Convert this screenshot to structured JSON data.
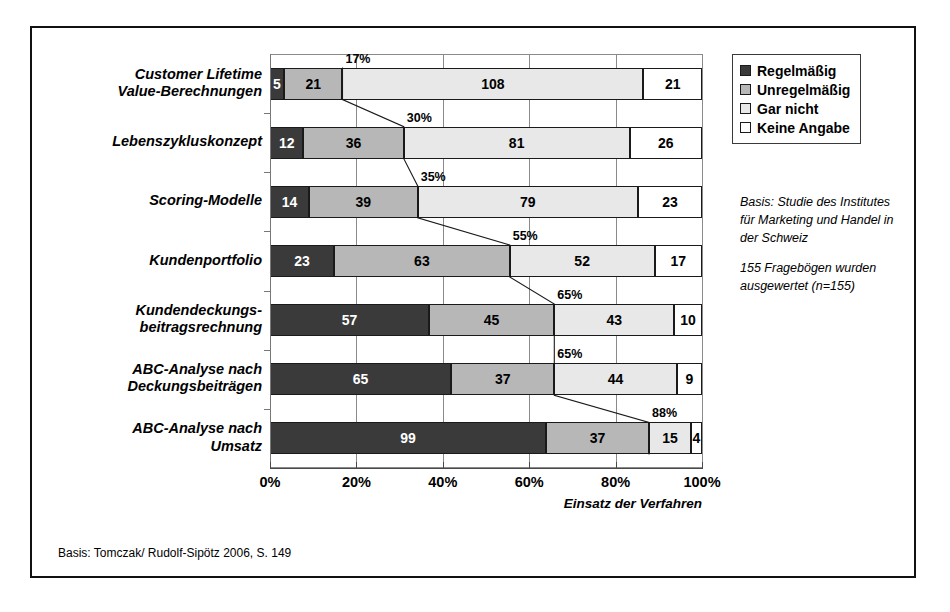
{
  "chart_data": {
    "type": "bar",
    "orientation": "horizontal",
    "stacked": true,
    "normalized": true,
    "title": "",
    "xlabel": "Einsatz der Verfahren",
    "ylabel": "",
    "xlim": [
      0,
      100
    ],
    "xticks": [
      "0%",
      "20%",
      "40%",
      "60%",
      "80%",
      "100%"
    ],
    "xtick_values": [
      0,
      20,
      40,
      60,
      80,
      100
    ],
    "grid": true,
    "legend_position": "top-right",
    "total": 155,
    "categories": [
      "Customer Lifetime Value-Berechnungen",
      "Lebenszykluskonzept",
      "Scoring-Modelle",
      "Kundenportfolio",
      "Kundendeckungs-beitragsrechnung",
      "ABC-Analyse nach Deckungsbeiträgen",
      "ABC-Analyse nach Umsatz"
    ],
    "category_lines": [
      [
        "Customer Lifetime",
        "Value-Berechnungen"
      ],
      [
        "Lebenszykluskonzept"
      ],
      [
        "Scoring-Modelle"
      ],
      [
        "Kundenportfolio"
      ],
      [
        "Kundendeckungs-",
        "beitragsrechnung"
      ],
      [
        "ABC-Analyse nach",
        "Deckungsbeiträgen"
      ],
      [
        "ABC-Analyse nach",
        "Umsatz"
      ]
    ],
    "series": [
      {
        "name": "Regelmäßig",
        "color": "#3a3a3a",
        "values": [
          5,
          12,
          14,
          23,
          57,
          65,
          99
        ]
      },
      {
        "name": "Unregelmäßig",
        "color": "#b7b7b7",
        "values": [
          21,
          36,
          39,
          63,
          45,
          37,
          37
        ]
      },
      {
        "name": "Gar nicht",
        "color": "#e8e8e8",
        "values": [
          108,
          81,
          79,
          52,
          43,
          44,
          15
        ]
      },
      {
        "name": "Keine Angabe",
        "color": "#ffffff",
        "values": [
          21,
          26,
          23,
          17,
          10,
          9,
          4
        ]
      }
    ],
    "annotations": {
      "label": "cumulative share of Regelmäßig + Unregelmäßig",
      "values": [
        "17%",
        "30%",
        "35%",
        "55%",
        "65%",
        "65%",
        "88%"
      ]
    }
  },
  "legend": {
    "items": [
      {
        "label": "Regelmäßig",
        "swatch": "dark-swatch"
      },
      {
        "label": "Unregelmäßig",
        "swatch": "medium-gray-swatch"
      },
      {
        "label": "Gar nicht",
        "swatch": "light-gray-swatch"
      },
      {
        "label": "Keine Angabe",
        "swatch": "white-swatch"
      }
    ]
  },
  "sidenote": {
    "para1": "Basis: Studie des Institutes für Marketing und Handel in der Schweiz",
    "para2": "155 Fragebögen wurden ausgewertet (n=155)"
  },
  "footer": {
    "text": "Basis: Tomczak/ Rudolf-Sipötz 2006, S. 149"
  },
  "colors": {
    "regelmaessig": "#3a3a3a",
    "unregelmaessig": "#b7b7b7",
    "gar_nicht": "#e8e8e8",
    "keine_angabe": "#ffffff",
    "frame": "#111111",
    "grid": "#8a8a8a"
  }
}
